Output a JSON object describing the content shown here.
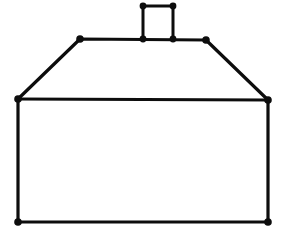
{
  "figure": {
    "background_color": "#ffffff",
    "stroke_color": "#0d0d0d",
    "vertex_color": "#0d0d0d",
    "canvas": {
      "width": 283,
      "height": 233
    }
  },
  "chart_data": {
    "type": "scatter",
    "xlabel": "",
    "ylabel": "",
    "xlim": [
      0,
      283
    ],
    "ylim": [
      0,
      233
    ],
    "grid": false,
    "legend": "none",
    "annotations": [
      "Rectangular house body with hipped trapezoidal roof and small rectangular chimney",
      "Every polygon vertex is marked with a filled black dot"
    ],
    "series": [
      {
        "name": "house-body",
        "closed": true,
        "x": [
          18,
          268,
          268,
          18
        ],
        "y": [
          99,
          100,
          222,
          222
        ]
      },
      {
        "name": "roof",
        "closed": true,
        "x": [
          18,
          80,
          206,
          268
        ],
        "y": [
          99,
          39,
          40,
          100
        ]
      },
      {
        "name": "chimney",
        "closed": false,
        "x": [
          143,
          143,
          173,
          173
        ],
        "y": [
          39,
          6,
          6,
          39
        ]
      }
    ],
    "vertices": [
      {
        "name": "chimney-top-left",
        "x": 143,
        "y": 6
      },
      {
        "name": "chimney-top-right",
        "x": 173,
        "y": 6
      },
      {
        "name": "chimney-base-left",
        "x": 143,
        "y": 39
      },
      {
        "name": "chimney-base-right",
        "x": 173,
        "y": 39
      },
      {
        "name": "ridge-left",
        "x": 80,
        "y": 39
      },
      {
        "name": "ridge-right",
        "x": 206,
        "y": 40
      },
      {
        "name": "eave-left",
        "x": 18,
        "y": 99
      },
      {
        "name": "eave-right",
        "x": 268,
        "y": 100
      },
      {
        "name": "base-left",
        "x": 18,
        "y": 222
      },
      {
        "name": "base-right",
        "x": 268,
        "y": 222
      }
    ],
    "vertex_radius": 3.4
  }
}
